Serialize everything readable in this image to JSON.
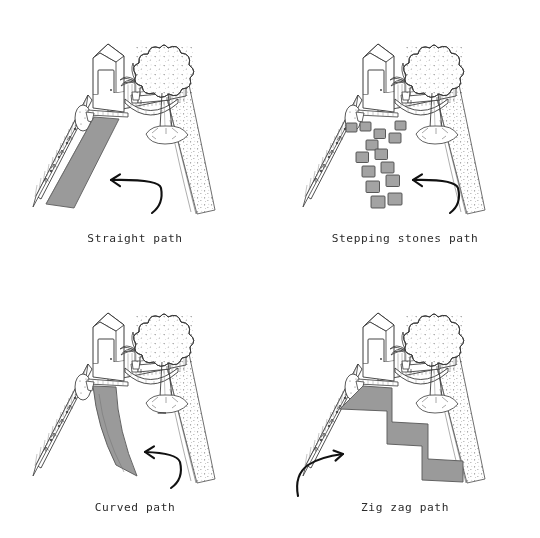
{
  "canvas": {
    "width": 540,
    "height": 538,
    "background_color": "#ffffff",
    "style": "hand-drawn black line illustration, grey fills"
  },
  "colors": {
    "ink": "#3a3a3a",
    "ink_dark": "#1d1d1d",
    "paving_fill": "#9a9a9a",
    "paving_stroke": "#5d5d5d",
    "stone_fill": "#a3a3a3",
    "stone_stroke": "#4a4a4a",
    "hedge_tone": "#8c8c8c",
    "caption_text": "#2b2b2b",
    "background": "#ffffff"
  },
  "layout": {
    "rows": 2,
    "columns": 2,
    "panel_width": 270,
    "panel_height": 269
  },
  "panels": [
    {
      "id": "straight",
      "caption": "Straight path",
      "position": "top-left",
      "path_type": "straight",
      "arrow": "curved-arrow-pointing-up-left",
      "scene_elements": [
        "garden-shed",
        "shed-door",
        "palm-plant",
        "garden-bench",
        "curved-deck",
        "slatted-fence-left",
        "slatted-fence-back",
        "large-tree",
        "tree-roots",
        "stippled-garden-bed-right",
        "border-plants"
      ]
    },
    {
      "id": "stepping-stones",
      "caption": "Stepping stones path",
      "position": "top-right",
      "path_type": "stepping-stones",
      "stone_count": 14,
      "arrow": "curved-arrow-pointing-up-left",
      "scene_elements": [
        "garden-shed",
        "shed-door",
        "palm-plant",
        "garden-bench",
        "curved-deck",
        "slatted-fence-left",
        "slatted-fence-back",
        "large-tree",
        "tree-roots",
        "stippled-garden-bed-right",
        "border-plants"
      ]
    },
    {
      "id": "curved",
      "caption": "Curved path",
      "position": "bottom-left",
      "path_type": "curved",
      "arrow": "curved-arrow-pointing-up-left",
      "scene_elements": [
        "garden-shed",
        "shed-door",
        "palm-plant",
        "garden-bench",
        "curved-deck",
        "slatted-fence-left",
        "slatted-fence-back",
        "large-tree",
        "tree-roots",
        "stippled-garden-bed-right",
        "border-plants"
      ]
    },
    {
      "id": "zigzag",
      "caption": "Zig zag path",
      "position": "bottom-right",
      "path_type": "zig-zag",
      "steps": 2,
      "arrow": "curved-arrow-pointing-up-right",
      "scene_elements": [
        "garden-shed",
        "shed-door",
        "palm-plant",
        "garden-bench",
        "curved-deck",
        "slatted-fence-left",
        "slatted-fence-back",
        "large-tree",
        "tree-roots",
        "stippled-garden-bed-right",
        "border-plants"
      ]
    }
  ]
}
